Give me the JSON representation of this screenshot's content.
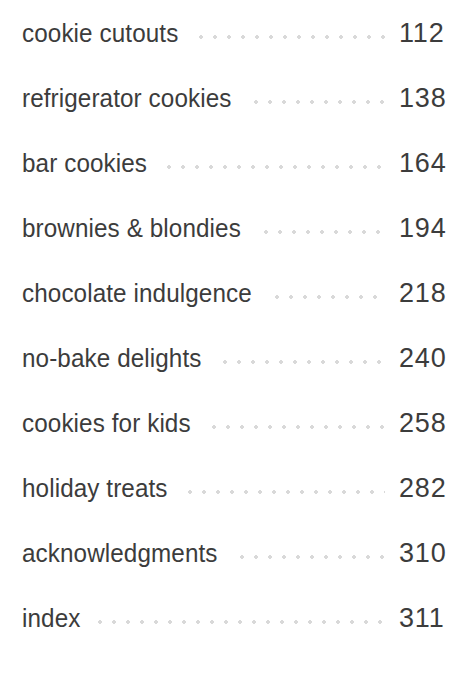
{
  "document": {
    "type": "table-of-contents",
    "background_color": "#ffffff",
    "text_color": "#3c3c3c",
    "leader_color": "#d9d9d9"
  },
  "entries": [
    {
      "title": "cookie cutouts",
      "page": "112"
    },
    {
      "title": "refrigerator cookies",
      "page": "138"
    },
    {
      "title": "bar cookies",
      "page": "164"
    },
    {
      "title": "brownies & blondies",
      "page": "194"
    },
    {
      "title": "chocolate indulgence",
      "page": "218"
    },
    {
      "title": "no-bake delights",
      "page": "240"
    },
    {
      "title": "cookies for kids",
      "page": "258"
    },
    {
      "title": "holiday treats",
      "page": "282"
    },
    {
      "title": "acknowledgments",
      "page": "310"
    },
    {
      "title": "index",
      "page": "311"
    }
  ]
}
